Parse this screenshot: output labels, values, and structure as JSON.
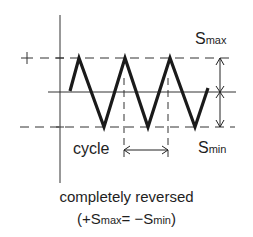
{
  "diagram": {
    "axis_markers": {
      "plus": "+",
      "minus": "−"
    },
    "labels": {
      "s_max": {
        "base": "S",
        "sub": "max"
      },
      "s_min": {
        "base": "S",
        "sub": "min"
      },
      "cycle": "cycle"
    },
    "caption": {
      "line1": "completely reversed",
      "line2_open": "(+S",
      "line2_sub1": "max",
      "line2_mid": "= −S",
      "line2_sub2": "min",
      "line2_close": ")"
    },
    "waveform": {
      "type": "triangular",
      "peaks": 3,
      "troughs": 3,
      "stroke_color": "#1a1a1a"
    }
  }
}
